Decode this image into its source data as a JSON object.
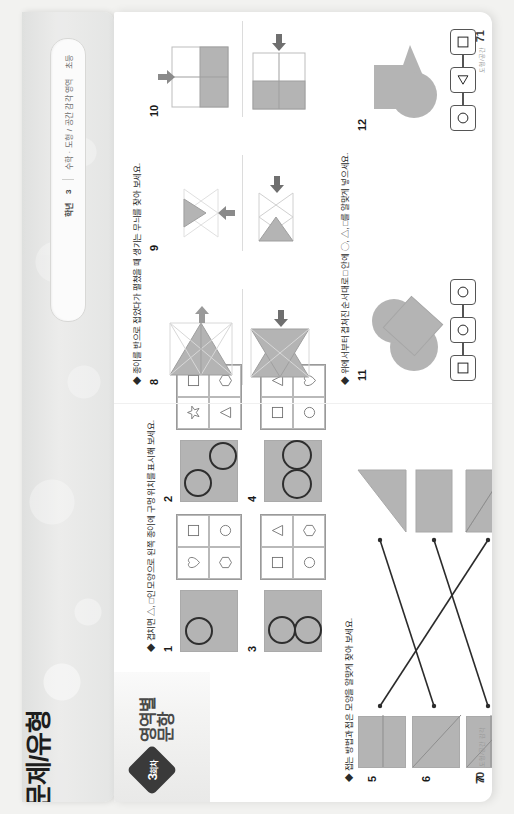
{
  "book": {
    "cover_title": "문제/유형",
    "cover_label_1": "초등",
    "cover_label_2": "수학 · 도형 / 공간 감각 영역",
    "cover_label_3": "3",
    "cover_label_4": "학년"
  },
  "left_page": {
    "round_badge_number": "3",
    "round_badge_unit": "회차",
    "section_title_line1": "영역별",
    "section_title_line2": "문항",
    "instruction_1": "◆ 겹치면 △, □인 모양으로 왼쪽 종이에 구멍 위치를 표시해 보세요.",
    "instruction_2": "◆ 접는 방법과 접은 모양을 알맞게 찾아 보세요.",
    "problems_holes": [
      {
        "number": "1",
        "holes": [
          {
            "x": 8,
            "y": 6,
            "r": 13
          }
        ],
        "options": [
          "square",
          "circle",
          "heart",
          "hexagon"
        ]
      },
      {
        "number": "2",
        "holes": [
          {
            "x": 4,
            "y": 4,
            "r": 13
          },
          {
            "x": 34,
            "y": 30,
            "r": 13
          }
        ],
        "options": [
          "square",
          "hexagon",
          "star",
          "triangle"
        ]
      },
      {
        "number": "3",
        "holes": [
          {
            "x": 8,
            "y": 4,
            "r": 13
          },
          {
            "x": 8,
            "y": 32,
            "r": 13
          }
        ],
        "options": [
          "triangle",
          "hexagon",
          "square",
          "circle"
        ]
      },
      {
        "number": "4",
        "holes": [
          {
            "x": 3,
            "y": 18,
            "r": 14
          },
          {
            "x": 33,
            "y": 18,
            "r": 14
          }
        ],
        "options": [
          "circle",
          "heart",
          "square",
          "triangle"
        ]
      }
    ],
    "problems_fold": [
      {
        "number": "5",
        "fold_kind": "horizontal"
      },
      {
        "number": "6",
        "fold_kind": "diagonal"
      },
      {
        "number": "7",
        "fold_kind": "diagonal-cross"
      }
    ],
    "fold_results": [
      "big-triangle",
      "rectangle",
      "trapezoid-triangle"
    ],
    "footer_note": "도형/공간 감각",
    "page_number": "70"
  },
  "right_page": {
    "instruction_3": "◆ 종이를 반으로 접었다가 펼쳤을 때 생기는 무늬를 찾아 보세요.",
    "instruction_4": "◆ 위에서부터 겹쳐진 순서대로 □ 안에 ◯, △, □를 알맞게 넣으세요.",
    "problems_symmetry": [
      {
        "number": "8",
        "arrow": "right",
        "shape": "triangle-fan"
      },
      {
        "number": "9",
        "arrow": "up",
        "shape": "star-triangles"
      },
      {
        "number": "10",
        "arrow": "down",
        "shape": "quad-square"
      }
    ],
    "problems_stack": [
      {
        "number": "11",
        "boxes": [
          "circle",
          "circle",
          "square"
        ]
      },
      {
        "number": "12",
        "boxes": [
          "square",
          "triangle",
          "circle"
        ]
      }
    ],
    "footer_note": "도형/공간",
    "page_number": "71"
  },
  "colors": {
    "shape_fill": "#b4b4b4",
    "shape_outline": "#2e2e2e",
    "badge_bg": "#3a3a3a",
    "page_bg": "#ffffff",
    "cover_bg": "#e6e6e5"
  }
}
